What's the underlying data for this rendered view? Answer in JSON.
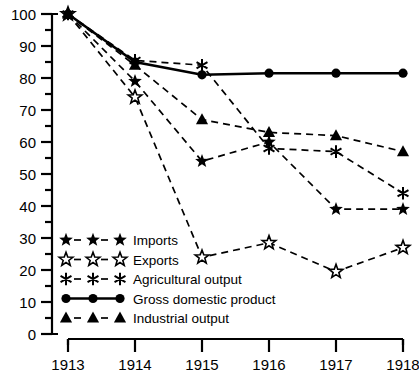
{
  "chart_data": {
    "type": "line",
    "title": "",
    "subtitle": "",
    "xlabel": "",
    "ylabel": "",
    "x": [
      "1913",
      "1914",
      "1915",
      "1916",
      "1917",
      "1918"
    ],
    "categories": [
      "1913",
      "1914",
      "1915",
      "1916",
      "1917",
      "1918"
    ],
    "xlim": [
      1913,
      1918
    ],
    "ylim": [
      0,
      100
    ],
    "y_ticks": [
      0,
      10,
      20,
      30,
      40,
      50,
      60,
      70,
      80,
      90,
      100
    ],
    "y_minor_ticks": [
      5,
      15,
      25,
      35,
      45,
      55,
      65,
      75,
      85,
      95
    ],
    "grid": false,
    "legend_position": "lower-left inside",
    "series": [
      {
        "name": "Imports",
        "marker": "filled-star",
        "linestyle": "dashed",
        "values": [
          100,
          79,
          54,
          60,
          39,
          39
        ]
      },
      {
        "name": "Exports",
        "marker": "open-star",
        "linestyle": "dashed",
        "values": [
          100,
          74,
          24,
          28.5,
          19.5,
          27
        ]
      },
      {
        "name": "Agricultural output",
        "marker": "asterisk",
        "linestyle": "dashed",
        "values": [
          100,
          85.5,
          84,
          58,
          57,
          44
        ]
      },
      {
        "name": "Gross domestic product",
        "marker": "filled-circle",
        "linestyle": "solid",
        "values": [
          100,
          85,
          81,
          81.5,
          81.5,
          81.5
        ]
      },
      {
        "name": "Industrial output",
        "marker": "filled-triangle",
        "linestyle": "dashed",
        "values": [
          100,
          84,
          67,
          63,
          62,
          57
        ]
      }
    ]
  },
  "axes": {
    "y_tick_labels": [
      "100",
      "90",
      "80",
      "70",
      "60",
      "50",
      "40",
      "30",
      "20",
      "10",
      "0"
    ],
    "x_tick_labels": [
      "1913",
      "1914",
      "1915",
      "1916",
      "1917",
      "1918"
    ]
  },
  "legend": {
    "items": [
      {
        "label": "Imports",
        "marker": "filled-star",
        "linestyle": "dashed"
      },
      {
        "label": "Exports",
        "marker": "open-star",
        "linestyle": "dashed"
      },
      {
        "label": "Agricultural output",
        "marker": "asterisk",
        "linestyle": "dashed"
      },
      {
        "label": "Gross domestic product",
        "marker": "filled-circle",
        "linestyle": "solid"
      },
      {
        "label": "Industrial output",
        "marker": "filled-triangle",
        "linestyle": "dashed"
      }
    ]
  },
  "colors": {
    "background": "#ffffff",
    "foreground": "#000000"
  }
}
